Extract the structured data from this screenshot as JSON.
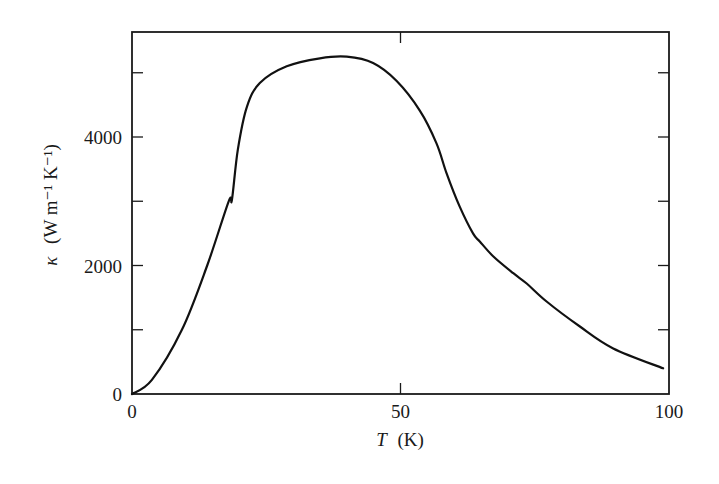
{
  "chart_data": {
    "type": "line",
    "title": "",
    "xlabel": "T (K)",
    "xlabel_italic_part": "T",
    "xlabel_unit": "(K)",
    "ylabel": "κ (W m⁻¹ K⁻¹)",
    "ylabel_symbol": "κ",
    "ylabel_unit": "(W m⁻¹ K⁻¹)",
    "xlim": [
      0,
      100
    ],
    "ylim": [
      0,
      5650
    ],
    "x_ticks": [
      0,
      50,
      100
    ],
    "x_tick_labels": [
      "0",
      "50",
      "100"
    ],
    "y_ticks_major": [
      0,
      2000,
      4000
    ],
    "y_tick_labels": [
      "0",
      "2000",
      "4000"
    ],
    "y_ticks_minor": [
      1000,
      3000,
      5000
    ],
    "grid": false,
    "legend": null,
    "series": [
      {
        "name": "thermal conductivity",
        "color": "#111111",
        "x": [
          0,
          3.7,
          9.3,
          14,
          18,
          18.6,
          19.7,
          21.4,
          23.8,
          28.8,
          35,
          40,
          44.9,
          49.3,
          53.6,
          56.7,
          58.6,
          61,
          63.5,
          64.8,
          67.3,
          71,
          73.5,
          77.2,
          83.4,
          89.6,
          98.9
        ],
        "values": [
          0,
          220,
          1000,
          2000,
          3000,
          3020,
          3800,
          4470,
          4840,
          5100,
          5225,
          5250,
          5150,
          4870,
          4410,
          3900,
          3430,
          2920,
          2500,
          2370,
          2140,
          1880,
          1720,
          1440,
          1050,
          710,
          400
        ]
      }
    ]
  }
}
